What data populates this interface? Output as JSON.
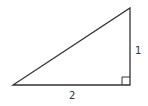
{
  "diagram": {
    "type": "right-triangle",
    "vertices": {
      "left": [
        13,
        85
      ],
      "right_angle": [
        130,
        85
      ],
      "top": [
        130,
        8
      ]
    },
    "right_angle_marker_size": 8,
    "labels": {
      "vertical_side": "1",
      "horizontal_side": "2"
    },
    "stroke_color": "#333333"
  }
}
